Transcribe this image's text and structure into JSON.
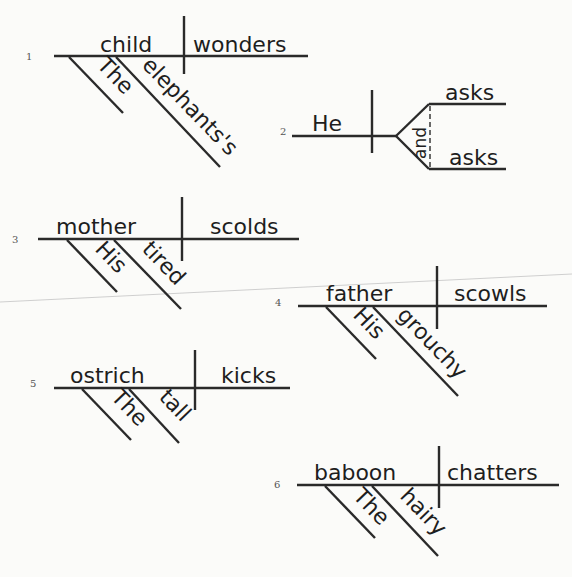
{
  "diagrams": [
    {
      "number": "1",
      "subject": "child",
      "predicate": "wonders",
      "modifiers": [
        "The",
        "elephants's"
      ]
    },
    {
      "number": "2",
      "subject": "He",
      "conjunction": "and",
      "predicates": [
        "asks",
        "asks"
      ]
    },
    {
      "number": "3",
      "subject": "mother",
      "predicate": "scolds",
      "modifiers": [
        "His",
        "tired"
      ]
    },
    {
      "number": "4",
      "subject": "father",
      "predicate": "scowls",
      "modifiers": [
        "His",
        "grouchy"
      ]
    },
    {
      "number": "5",
      "subject": "ostrich",
      "predicate": "kicks",
      "modifiers": [
        "The",
        "tall"
      ]
    },
    {
      "number": "6",
      "subject": "baboon",
      "predicate": "chatters",
      "modifiers": [
        "The",
        "hairy"
      ]
    }
  ],
  "colors": {
    "ink": "#2a2a2a",
    "paper": "#fbfbf9",
    "fold": "#cfcfcf"
  }
}
